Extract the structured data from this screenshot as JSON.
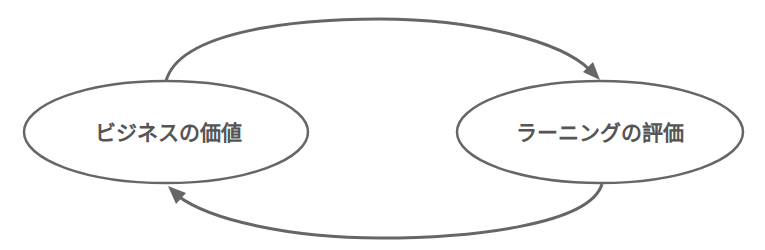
{
  "diagram": {
    "type": "cycle",
    "nodes": [
      {
        "id": "business-value",
        "label": "ビジネスの価値",
        "cx": 166,
        "cy": 132,
        "rx": 142,
        "ry": 51
      },
      {
        "id": "learning-evaluation",
        "label": "ラーニングの評価",
        "cx": 600,
        "cy": 132,
        "rx": 143,
        "ry": 51
      }
    ],
    "edges": [
      {
        "from": "business-value",
        "to": "learning-evaluation",
        "position": "top"
      },
      {
        "from": "learning-evaluation",
        "to": "business-value",
        "position": "bottom"
      }
    ],
    "colors": {
      "stroke": "#666666",
      "text": "#555555",
      "background": "#ffffff"
    }
  }
}
